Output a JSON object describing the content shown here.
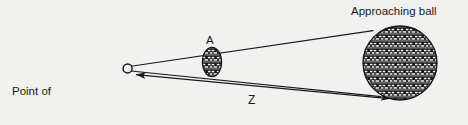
{
  "figure": {
    "background_color": "#f1f1ef",
    "ink_color": "#1a1a1a",
    "labels": {
      "observation_line1": "Point of",
      "observation_line2": "observation (O)",
      "approaching_ball": "Approaching ball",
      "near_ball": "A",
      "distance": "Z"
    },
    "objects": {
      "observation_point": {
        "name": "O",
        "cx": 127.5,
        "cy": 68.5,
        "r": 4.6
      },
      "near_ball": {
        "name": "A",
        "cx": 212,
        "cy": 62,
        "rx": 9.5,
        "ry": 14.5,
        "fill": "hatched"
      },
      "approaching_ball": {
        "name": "Approaching ball",
        "cx": 400,
        "cy": 63,
        "r": 37,
        "fill": "hatched"
      }
    },
    "sight_lines": [
      {
        "name": "upper-sight-line",
        "x1": 130,
        "y1": 66,
        "x2": 372,
        "y2": 31
      },
      {
        "name": "lower-sight-line",
        "x1": 130,
        "y1": 72,
        "x2": 380,
        "y2": 97
      }
    ],
    "distance_arrow": {
      "name": "Z",
      "x1": 133,
      "y1": 74,
      "x2": 392,
      "y2": 99,
      "arrow_head_start": true,
      "arrow_head_end": true
    }
  }
}
